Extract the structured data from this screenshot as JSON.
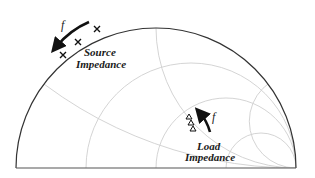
{
  "diagram": {
    "type": "smith-chart-upper-half",
    "colors": {
      "outer_circle": "#333333",
      "grid": "#cfcfcf",
      "text": "#1a1a1a",
      "arrow": "#111111"
    },
    "resistance_circles": [
      "1/3",
      "1",
      "3"
    ],
    "reactance_arcs": [
      "1/3",
      "1",
      "3"
    ],
    "source": {
      "label_line1": "Source",
      "label_line2": "Impedance",
      "frequency_label": "f",
      "marker": "x",
      "marker_count": 3
    },
    "load": {
      "label_line1": "Load",
      "label_line2": "Impedance",
      "frequency_label": "f",
      "marker": "triangle",
      "marker_count": 3
    }
  }
}
